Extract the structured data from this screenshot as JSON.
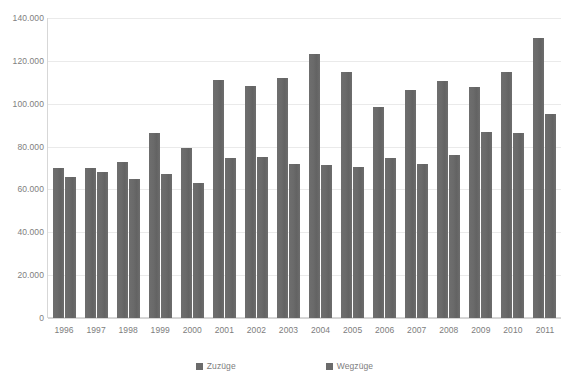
{
  "chart_data": {
    "type": "bar",
    "title": "",
    "subtitle": "",
    "xlabel": "",
    "ylabel": "",
    "categories": [
      "1996",
      "1997",
      "1998",
      "1999",
      "2000",
      "2001",
      "2002",
      "2003",
      "2004",
      "2005",
      "2006",
      "2007",
      "2008",
      "2009",
      "2010",
      "2011"
    ],
    "series": [
      {
        "name": "Zuzüge",
        "color": "#6b6b6b",
        "values": [
          70000,
          70200,
          72800,
          86500,
          79200,
          111300,
          108400,
          111800,
          123000,
          114800,
          98700,
          106600,
          110500,
          108000,
          114900,
          130500
        ]
      },
      {
        "name": "Wegzüge",
        "color": "#6b6b6b",
        "values": [
          65800,
          68300,
          64700,
          67200,
          63000,
          74600,
          75000,
          72000,
          71600,
          70300,
          74600,
          72000,
          75900,
          87000,
          86200,
          95000
        ]
      }
    ],
    "ylim": [
      0,
      140000
    ],
    "yticks": [
      0,
      20000,
      40000,
      60000,
      80000,
      100000,
      120000,
      140000
    ],
    "ytick_labels": [
      "0",
      "20.000",
      "40.000",
      "60.000",
      "80.000",
      "100.000",
      "120.000",
      "140.000"
    ],
    "grid": true,
    "legend_position": "bottom",
    "legend": [
      "Zuzüge",
      "Wegzüge"
    ],
    "annotations": []
  },
  "legend": {
    "items": [
      {
        "label": "Zuzüge",
        "swatch": "legend-swatch-icon"
      },
      {
        "label": "Wegzüge",
        "swatch": "legend-swatch-icon"
      }
    ]
  }
}
